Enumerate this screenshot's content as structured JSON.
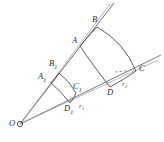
{
  "figure": {
    "type": "geometric-diagram",
    "canvas": {
      "width": 164,
      "height": 142
    },
    "colors": {
      "stroke": "#3a3a3a",
      "stroke_light": "#8a8a8a",
      "background": "#ffffff",
      "label": "#2b2b2b"
    },
    "origin": {
      "label": "O",
      "x": 20,
      "y": 124,
      "label_x": 9,
      "label_y": 119
    },
    "points": [
      {
        "name": "A",
        "label": "A",
        "sub": "",
        "x": 80,
        "y": 46,
        "label_x": 72,
        "label_y": 36
      },
      {
        "name": "B",
        "label": "B",
        "sub": "",
        "x": 97,
        "y": 27,
        "label_x": 92,
        "label_y": 15
      },
      {
        "name": "C",
        "label": "C",
        "sub": "",
        "x": 136,
        "y": 71,
        "label_x": 139,
        "label_y": 64
      },
      {
        "name": "D",
        "label": "D",
        "sub": "",
        "x": 110,
        "y": 87,
        "label_x": 107,
        "label_y": 88
      },
      {
        "name": "A1",
        "label": "A",
        "sub": "1",
        "x": 51,
        "y": 83,
        "label_x": 38,
        "label_y": 72
      },
      {
        "name": "B1",
        "label": "B",
        "sub": "1",
        "x": 59,
        "y": 73,
        "label_x": 49,
        "label_y": 59
      },
      {
        "name": "C1",
        "label": "C",
        "sub": "1",
        "x": 76,
        "y": 93,
        "label_x": 73,
        "label_y": 82
      },
      {
        "name": "D1",
        "label": "D",
        "sub": "1",
        "x": 70,
        "y": 103,
        "label_x": 64,
        "label_y": 104
      }
    ],
    "radius_labels": [
      {
        "name": "r1",
        "label": "r",
        "sub": "1",
        "x": 79,
        "y": 103
      },
      {
        "name": "r2",
        "label": "r",
        "sub": "2",
        "x": 122,
        "y": 81
      }
    ],
    "rays": [
      {
        "name": "upper-ray",
        "from": [
          20,
          124
        ],
        "to": [
          114,
          3
        ]
      },
      {
        "name": "lower-ray",
        "from": [
          20,
          124
        ],
        "to": [
          161,
          55
        ]
      }
    ]
  }
}
